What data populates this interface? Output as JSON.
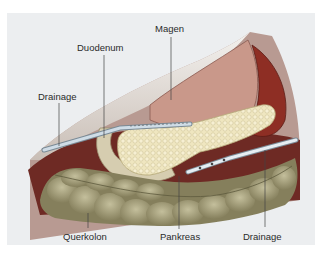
{
  "figure": {
    "labels": {
      "magen": "Magen",
      "duodenum": "Duodenum",
      "drainage_left": "Drainage",
      "querkolon": "Querkolon",
      "pankreas": "Pankreas",
      "drainage_right": "Drainage"
    },
    "colors": {
      "panel_background": "#eceef0",
      "abdominal_wall": "#b89a92",
      "abdominal_wall_shadow": "#8a6a60",
      "stomach": "#c9988a",
      "spleen": "#8e2e24",
      "retroperitoneum": "#6e2a24",
      "pancreas": "#efe6c0",
      "duodenum": "#d6cdb0",
      "colon": "#9f9a78",
      "drain_tube": "#c8d6e0",
      "leader_line": "#444444",
      "label_text": "#2a2a2a"
    }
  }
}
